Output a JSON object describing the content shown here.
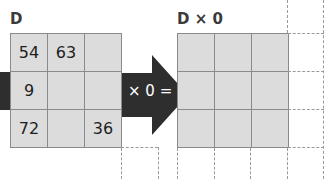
{
  "left_matrix": {
    "label": "D",
    "cells": [
      [
        "54",
        "63",
        ""
      ],
      [
        "9",
        "",
        ""
      ],
      [
        "72",
        "",
        "36"
      ]
    ]
  },
  "operation": {
    "label": "× 0 ="
  },
  "right_matrix": {
    "label": "D × 0",
    "cells": [
      [
        "",
        "",
        ""
      ],
      [
        "",
        "",
        ""
      ],
      [
        "",
        "",
        ""
      ]
    ]
  },
  "colors": {
    "cell_fill": "#dcdcdc",
    "grid_line": "#8a8a8a",
    "arrow": "#2e2e2e",
    "dashed": "#9a9a9a"
  }
}
